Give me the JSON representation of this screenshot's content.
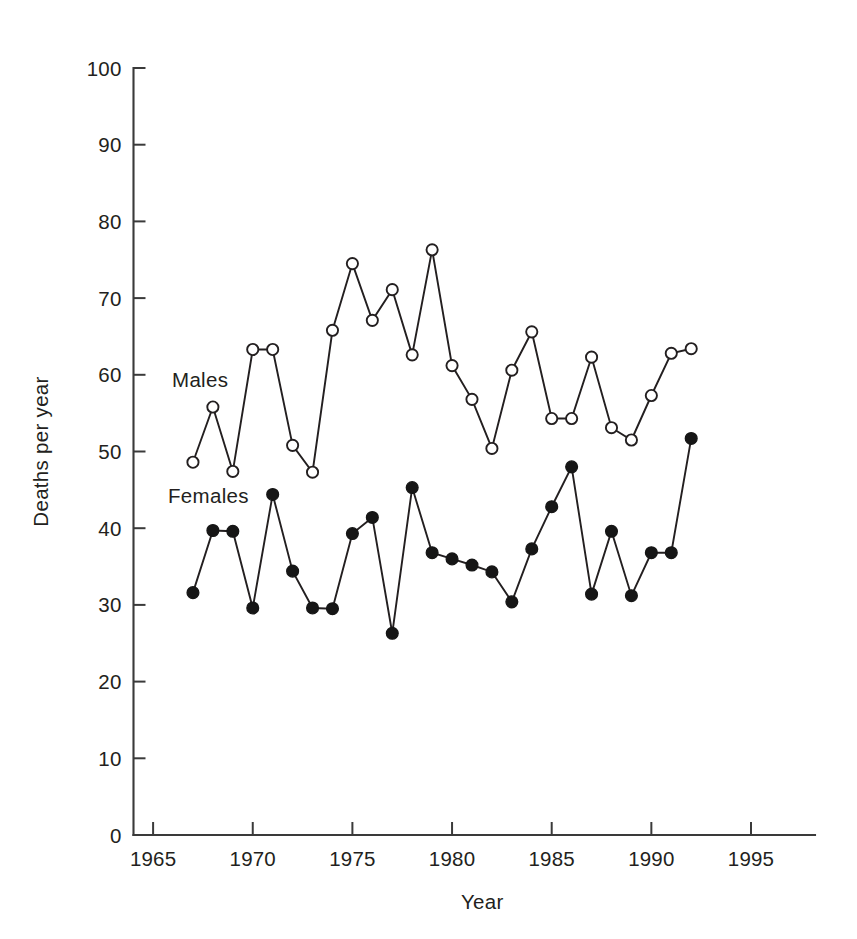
{
  "chart_data": {
    "type": "line",
    "title": "",
    "subtitle": "",
    "xlabel": "Year",
    "ylabel": "Deaths per year",
    "xlim": [
      1963.0,
      1997.3
    ],
    "ylim": [
      0,
      100
    ],
    "xticks": [
      1965,
      1970,
      1975,
      1980,
      1985,
      1990,
      1995
    ],
    "xtick_labels": [
      "1965",
      "1970",
      "1975",
      "1980",
      "1985",
      "1990",
      "1995"
    ],
    "yticks": [
      0,
      10,
      20,
      30,
      40,
      50,
      60,
      70,
      80,
      90,
      100
    ],
    "ytick_labels": [
      "0",
      "10",
      "20",
      "30",
      "40",
      "50",
      "60",
      "70",
      "80",
      "90",
      "100"
    ],
    "grid": false,
    "legend_position": "inline-annotation",
    "x": [
      1967,
      1968,
      1969,
      1970,
      1971,
      1972,
      1973,
      1974,
      1975,
      1976,
      1977,
      1978,
      1979,
      1980,
      1981,
      1982,
      1983,
      1984,
      1985,
      1986,
      1987,
      1988,
      1989,
      1990,
      1991,
      1992
    ],
    "series": [
      {
        "name": "Males",
        "marker": "open-circle",
        "label_x": 1965.95,
        "label_y": 58.4,
        "values": [
          48.6,
          55.8,
          47.4,
          63.3,
          63.3,
          50.8,
          47.3,
          65.8,
          74.5,
          67.1,
          71.1,
          62.6,
          76.3,
          61.2,
          56.8,
          50.4,
          60.6,
          65.6,
          54.3,
          54.3,
          62.3,
          53.1,
          51.5,
          57.3,
          62.8,
          63.4
        ]
      },
      {
        "name": "Females",
        "marker": "filled-circle",
        "label_x": 1965.75,
        "label_y": 43.3,
        "values": [
          31.6,
          39.7,
          39.6,
          29.6,
          44.4,
          34.4,
          29.6,
          29.5,
          39.3,
          41.4,
          26.3,
          45.3,
          36.8,
          36.0,
          35.2,
          34.3,
          30.4,
          37.3,
          42.8,
          48.0,
          31.4,
          39.6,
          31.2,
          36.8,
          36.8,
          51.7
        ]
      }
    ],
    "series_trailing": {
      "Females_last": 31.4,
      "Females_last_x": 1992
    }
  },
  "annotations": {
    "males_label": "Males",
    "females_label": "Females"
  }
}
